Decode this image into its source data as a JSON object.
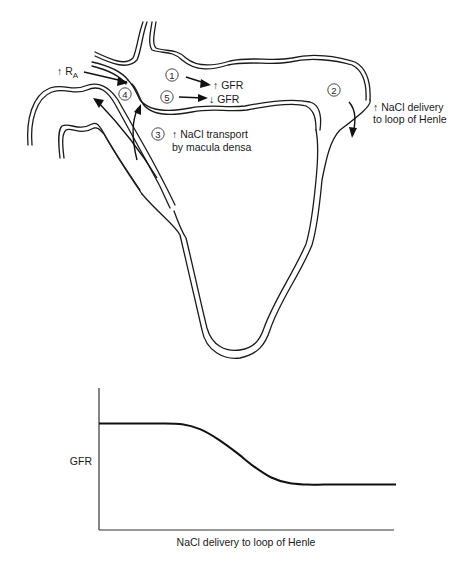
{
  "diagram": {
    "steps": [
      {
        "number": "1",
        "label": "↑ GFR"
      },
      {
        "number": "2",
        "label_line1": "↑ NaCl delivery",
        "label_line2": "to loop of Henle"
      },
      {
        "number": "3",
        "label_line1": "↑ NaCl transport",
        "label_line2": "by macula densa"
      },
      {
        "number": "4",
        "label": "↑ R",
        "label_subscript": "A"
      },
      {
        "number": "5",
        "label": "↓ GFR"
      }
    ]
  },
  "chart_data": {
    "type": "line",
    "title": "",
    "xlabel": "NaCl delivery to loop of Henle",
    "ylabel": "GFR",
    "xlim": [
      0,
      100
    ],
    "ylim": [
      0,
      100
    ],
    "grid": false,
    "legend": "none",
    "series": [
      {
        "name": "GFR",
        "x": [
          0,
          10,
          20,
          28,
          34,
          40,
          46,
          52,
          58,
          64,
          70,
          76,
          85,
          100
        ],
        "y": [
          75,
          75,
          75,
          74.5,
          71,
          64,
          55,
          45,
          37,
          33,
          32,
          32,
          32,
          32
        ]
      }
    ]
  }
}
